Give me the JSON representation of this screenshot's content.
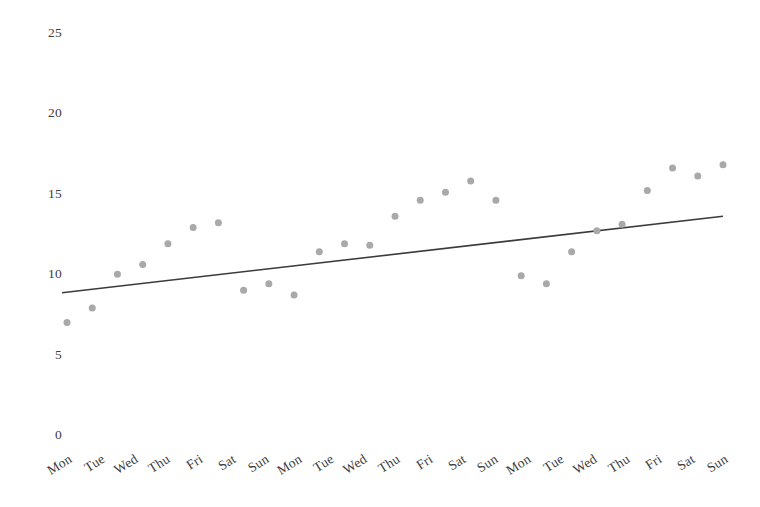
{
  "chart_data": {
    "type": "scatter",
    "title": "",
    "subtitle": "",
    "xlabel": "",
    "ylabel": "",
    "grid": false,
    "legend": "none",
    "ylim": [
      0,
      25
    ],
    "yticks": [
      0,
      5,
      10,
      15,
      20,
      25
    ],
    "ytick_labels": [
      "0",
      "5",
      "10",
      "15",
      "20",
      "25"
    ],
    "categories": [
      "Mon",
      "Tue",
      "Wed",
      "Thu",
      "Fri",
      "Sat",
      "Sun",
      "Mon",
      "Tue",
      "Wed",
      "Thu",
      "Fri",
      "Sat",
      "Sun",
      "Mon",
      "Tue",
      "Wed",
      "Thu",
      "Fri",
      "Sat",
      "Sun"
    ],
    "x": [
      1,
      2,
      3,
      4,
      5,
      6,
      7,
      8,
      9,
      10,
      11,
      12,
      13,
      14,
      15,
      16,
      17,
      18,
      19,
      20,
      21,
      22,
      23,
      24,
      25,
      26,
      27
    ],
    "series": [
      {
        "name": "observations",
        "marker": "circle",
        "color": "#a9a9a9",
        "marker_size": 7,
        "points": [
          {
            "x": 1,
            "label": "Mon",
            "value": 7.0
          },
          {
            "x": 2,
            "label": "Tue",
            "value": 7.9
          },
          {
            "x": 3,
            "label": "Wed",
            "value": 10.0
          },
          {
            "x": 4,
            "label": "Thu",
            "value": 10.6
          },
          {
            "x": 5,
            "label": "Fri",
            "value": 11.9
          },
          {
            "x": 6,
            "label": "Sat",
            "value": 12.9
          },
          {
            "x": 7,
            "label": "Sat",
            "value": 13.2
          },
          {
            "x": 8,
            "label": "Sun",
            "value": 9.0
          },
          {
            "x": 9,
            "label": "Mon",
            "value": 9.4
          },
          {
            "x": 10,
            "label": "Tue",
            "value": 8.7
          },
          {
            "x": 11,
            "label": "Wed",
            "value": 11.4
          },
          {
            "x": 12,
            "label": "Wed",
            "value": 11.9
          },
          {
            "x": 13,
            "label": "Thu",
            "value": 11.8
          },
          {
            "x": 14,
            "label": "Fri",
            "value": 13.6
          },
          {
            "x": 15,
            "label": "Sat",
            "value": 14.6
          },
          {
            "x": 16,
            "label": "Sun",
            "value": 15.1
          },
          {
            "x": 17,
            "label": "Sun",
            "value": 15.8
          },
          {
            "x": 18,
            "label": "Sun",
            "value": 14.6
          },
          {
            "x": 19,
            "label": "Mon",
            "value": 9.9
          },
          {
            "x": 20,
            "label": "Tue",
            "value": 9.4
          },
          {
            "x": 21,
            "label": "Wed",
            "value": 11.4
          },
          {
            "x": 22,
            "label": "Thu",
            "value": 12.7
          },
          {
            "x": 23,
            "label": "Thu",
            "value": 13.1
          },
          {
            "x": 24,
            "label": "Fri",
            "value": 15.2
          },
          {
            "x": 25,
            "label": "Sat",
            "value": 16.6
          },
          {
            "x": 26,
            "label": "Sat",
            "value": 16.1
          },
          {
            "x": 27,
            "label": "Sun",
            "value": 16.8
          }
        ]
      }
    ],
    "trendline": {
      "name": "trend",
      "color": "#3b3b3b",
      "width": 1.6,
      "start_value": 8.85,
      "end_value": 13.6
    }
  },
  "axes": {
    "y_axis_name": "y-axis",
    "x_axis_name": "x-axis",
    "x_label_rotation_deg": -32
  }
}
